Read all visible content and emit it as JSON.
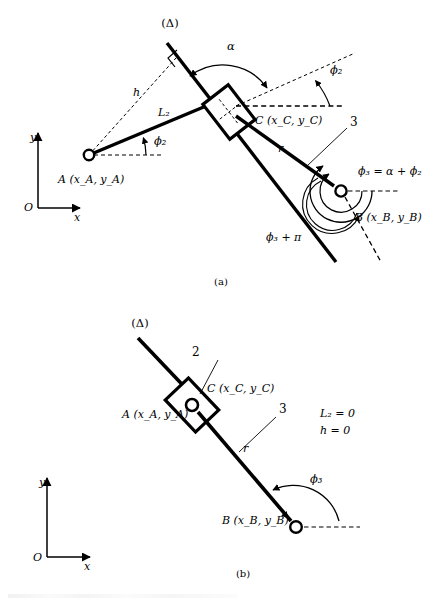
{
  "figure": {
    "title_note": "Kinematic diagram of a slider on a rotating link (inverted slider-crank), two configurations",
    "panels": [
      {
        "id": "a",
        "caption": "(a)",
        "axes": {
          "origin_label": "O",
          "x_label": "x",
          "y_label": "y"
        },
        "labels": {
          "delta_line": "(Δ)",
          "alpha": "α",
          "phi2_at_C": "ϕ₂",
          "phi2_at_A": "ϕ₂",
          "h": "h",
          "L2": "L₂",
          "r": "r",
          "link3": "3",
          "point_C": "C (x_C, y_C)",
          "point_A": "A (x_A, y_A)",
          "point_B": "B (x_B, y_B)",
          "phi3_relation": "ϕ₃ = α + ϕ₂",
          "phi3_plus_pi": "ϕ₃ + π"
        }
      },
      {
        "id": "b",
        "caption": "(b)",
        "axes": {
          "origin_label": "O",
          "x_label": "x",
          "y_label": "y"
        },
        "labels": {
          "delta_line": "(Δ)",
          "slider2": "2",
          "link3": "3",
          "r": "r",
          "phi3": "ϕ₃",
          "point_C": "C (x_C, y_C)",
          "point_A": "A (x_A, y_A)",
          "point_B": "B (x_B, y_B)",
          "condition_L2": "L₂ = 0",
          "condition_h": "h = 0"
        }
      }
    ]
  },
  "style": {
    "stroke": "#000000",
    "background": "#ffffff"
  }
}
